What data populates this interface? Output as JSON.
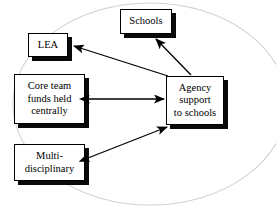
{
  "diagram": {
    "background_shape": {
      "name": "enclosing-ellipse",
      "type": "ellipse",
      "stroke_color": "#d2d2d2"
    },
    "box_style": {
      "fill_color": "#ffffff",
      "border_color": "#000000",
      "shadow_color": "#0a0a0a"
    },
    "arrow_color": "#000000",
    "nodes": [
      {
        "id": "schools",
        "label": "Schools",
        "x": 120,
        "y": 9,
        "width": 52,
        "height": 25
      },
      {
        "id": "lea",
        "label": "LEA",
        "x": 28,
        "y": 33,
        "width": 40,
        "height": 24
      },
      {
        "id": "core-team",
        "label": "Core team\nfunds held\ncentrally",
        "x": 14,
        "y": 74,
        "width": 71,
        "height": 50
      },
      {
        "id": "agency",
        "label": "Agency\nsupport\nto schools",
        "x": 166,
        "y": 76,
        "width": 58,
        "height": 49
      },
      {
        "id": "multi-disciplinary",
        "label": "Multi-\ndisciplinary",
        "x": 14,
        "y": 144,
        "width": 71,
        "height": 37
      }
    ],
    "edges": [
      {
        "id": "agency-to-schools",
        "from": "agency",
        "to": "schools",
        "direction": "single",
        "arrowheads": "end"
      },
      {
        "id": "agency-to-lea",
        "from": "agency",
        "to": "lea",
        "direction": "single",
        "arrowheads": "end"
      },
      {
        "id": "core-team-agency",
        "from": "core-team",
        "to": "agency",
        "direction": "double",
        "arrowheads": "both"
      },
      {
        "id": "multi-disciplinary-agency",
        "from": "multi-disciplinary",
        "to": "agency",
        "direction": "double",
        "arrowheads": "both"
      }
    ]
  }
}
